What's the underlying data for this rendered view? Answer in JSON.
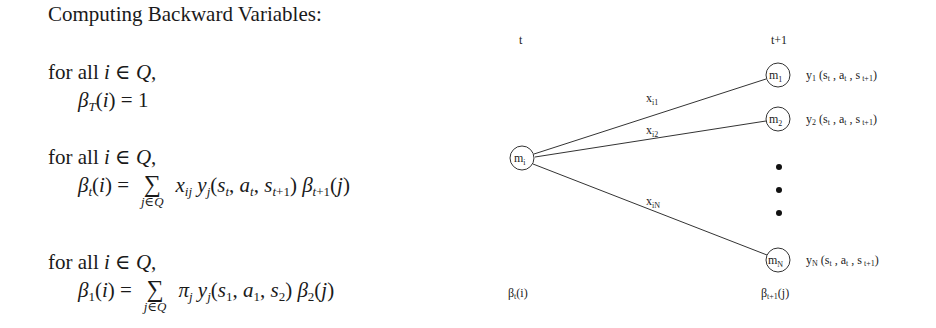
{
  "title": "Computing Backward Variables:",
  "blocks": [
    {
      "for_all": "for all i ∈ Q,",
      "beta": "β",
      "beta_sub": "T",
      "lhs_rest": "(i) = 1"
    },
    {
      "for_all": "for all i ∈ Q,",
      "beta": "β",
      "beta_sub": "t",
      "lhs_rest": "(i) =",
      "sum": "∑",
      "sum_sub": "j∈Q",
      "rhs": "x_ij y_j(s_t, a_t, s_t+1) β_t+1(j)"
    },
    {
      "for_all": "for all i ∈ Q,",
      "beta": "β",
      "beta_sub": "1",
      "lhs_rest": "(i) =",
      "sum": "∑",
      "sum_sub": "j∈Q",
      "rhs": "π_j y_j(s_1, a_1, s_2) β_2(j)"
    }
  ],
  "diagram": {
    "time_left": "t",
    "time_right": "t+1",
    "source_node": "m_i",
    "target_nodes": [
      {
        "label": "m_1",
        "emission": "y_1 (s_t , a_t , s_t+1)",
        "edge": "x_i1"
      },
      {
        "label": "m_2",
        "emission": "y_2 (s_t , a_t , s_t+1)",
        "edge": "x_i2"
      },
      {
        "label": "m_N",
        "emission": "y_N (s_t , a_t , s_t+1)",
        "edge": "x_iN"
      }
    ],
    "beta_left": "β_t(i)",
    "beta_right": "β_t+1(j)"
  }
}
